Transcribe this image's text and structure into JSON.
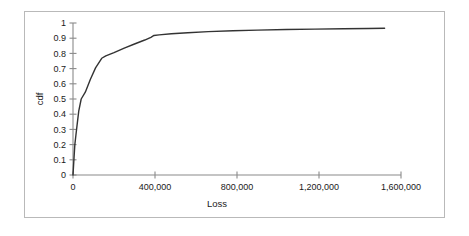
{
  "chart_data": {
    "type": "line",
    "title": "",
    "xlabel": "Loss",
    "ylabel": "cdf",
    "xlim": [
      0,
      1600000
    ],
    "ylim": [
      0,
      1
    ],
    "grid": false,
    "legend": "none",
    "x_tick_labels": [
      "0",
      "400,000",
      "800,000",
      "1,200,000",
      "1,600,000"
    ],
    "x_tick_values": [
      0,
      400000,
      800000,
      1200000,
      1600000
    ],
    "y_tick_labels": [
      "0",
      "0.1",
      "0.2",
      "0.3",
      "0.4",
      "0.5",
      "0.6",
      "0.7",
      "0.8",
      "0.9",
      "1"
    ],
    "y_tick_values": [
      0,
      0.1,
      0.2,
      0.3,
      0.4,
      0.5,
      0.6,
      0.7,
      0.8,
      0.9,
      1
    ],
    "series": [
      {
        "name": "cdf",
        "color": "#333333",
        "x": [
          0,
          4000,
          9000,
          14000,
          20000,
          28000,
          40000,
          60000,
          85000,
          110000,
          140000,
          160000,
          200000,
          250000,
          300000,
          350000,
          380000,
          395000,
          420000,
          480000,
          560000,
          660000,
          780000,
          900000,
          1040000,
          1180000,
          1320000,
          1440000,
          1520000
        ],
        "y": [
          0.0,
          0.09,
          0.2,
          0.26,
          0.33,
          0.42,
          0.5,
          0.545,
          0.63,
          0.705,
          0.768,
          0.784,
          0.805,
          0.835,
          0.862,
          0.888,
          0.906,
          0.918,
          0.922,
          0.929,
          0.936,
          0.943,
          0.949,
          0.953,
          0.957,
          0.96,
          0.962,
          0.964,
          0.965
        ]
      }
    ]
  }
}
